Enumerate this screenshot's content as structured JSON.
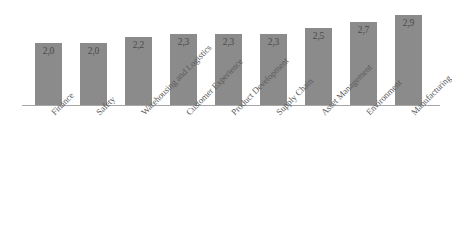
{
  "chart_data": {
    "type": "bar",
    "title": "",
    "subtitle": "",
    "xlabel": "",
    "ylabel": "",
    "ylim": [
      0,
      3.4
    ],
    "grid": false,
    "legend": false,
    "legend_position": "none",
    "decimal_separator": ",",
    "orientation": "vertical",
    "bar_color": "#8b8b8b",
    "axis_color": "#a6a6a6",
    "label_rotation": -45,
    "categories": [
      "Finance",
      "Safety",
      "Warehousing and Logistics",
      "Customer Experience",
      "Product Development",
      "Supply Chain",
      "Asset Management",
      "Environment",
      "Manufacturing"
    ],
    "values": [
      2.0,
      2.0,
      2.2,
      2.3,
      2.3,
      2.3,
      2.5,
      2.7,
      2.9
    ],
    "value_labels": [
      "2,0",
      "2,0",
      "2,2",
      "2,3",
      "2,3",
      "2,3",
      "2,5",
      "2,7",
      "2,9"
    ],
    "annotations": []
  }
}
